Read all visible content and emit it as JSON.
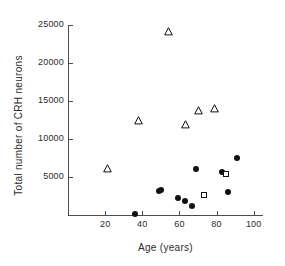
{
  "chart_data": {
    "type": "scatter",
    "title": "",
    "xlabel": "Age (years)",
    "ylabel": "Total number of CRH neurons",
    "xlim": [
      0,
      105
    ],
    "ylim": [
      0,
      25000
    ],
    "grid": false,
    "legend": "none",
    "xticks": [
      20,
      40,
      60,
      80,
      100
    ],
    "xticklabels": [
      "20",
      "40",
      "60",
      "80",
      "100"
    ],
    "yticks": [
      5000,
      10000,
      15000,
      20000,
      25000
    ],
    "yticklabels": [
      "5000",
      "10000",
      "15000",
      "20000",
      "25000"
    ],
    "series": [
      {
        "name": "open-triangle-group",
        "marker": "triangle-open",
        "color": "#111111",
        "points": [
          {
            "x": 21,
            "y": 6100
          },
          {
            "x": 38,
            "y": 12400
          },
          {
            "x": 54,
            "y": 24100
          },
          {
            "x": 63,
            "y": 11900
          },
          {
            "x": 70,
            "y": 13800
          },
          {
            "x": 79,
            "y": 14000
          }
        ]
      },
      {
        "name": "filled-circle-group",
        "marker": "circle-filled",
        "color": "#111111",
        "points": [
          {
            "x": 36,
            "y": 100
          },
          {
            "x": 49,
            "y": 3100
          },
          {
            "x": 50,
            "y": 3300
          },
          {
            "x": 59,
            "y": 2300
          },
          {
            "x": 63,
            "y": 1900
          },
          {
            "x": 67,
            "y": 1200
          },
          {
            "x": 69,
            "y": 6100
          },
          {
            "x": 83,
            "y": 5700
          },
          {
            "x": 86,
            "y": 3000
          },
          {
            "x": 91,
            "y": 7500
          }
        ]
      },
      {
        "name": "open-square-group",
        "marker": "square-open",
        "color": "#111111",
        "points": [
          {
            "x": 73,
            "y": 2600
          },
          {
            "x": 85,
            "y": 5400
          }
        ]
      }
    ]
  },
  "axes": {
    "x_title": "Age (years)",
    "y_title": "Total number of CRH neurons",
    "x_tick_labels": [
      "20",
      "40",
      "60",
      "80",
      "100"
    ],
    "y_tick_labels": [
      "5000",
      "10000",
      "15000",
      "20000",
      "25000"
    ]
  },
  "colors": {
    "marker": "#111111",
    "axis": "#4d4d4d",
    "text": "#2b2b2b",
    "background": "#ffffff"
  }
}
